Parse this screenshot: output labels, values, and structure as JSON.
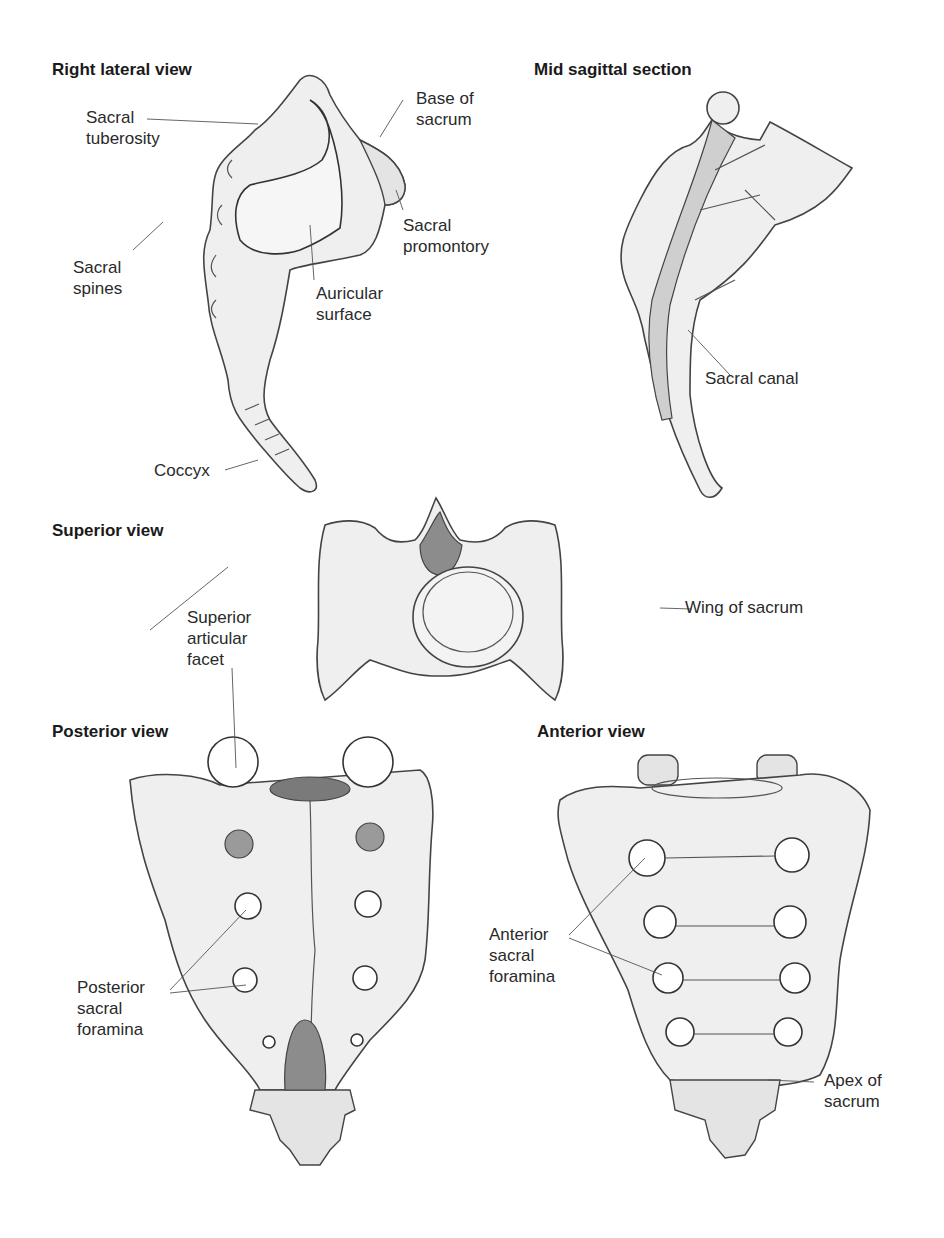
{
  "figure": {
    "background": "#ffffff",
    "panels": [
      {
        "id": "right-lateral",
        "heading": "Right lateral view",
        "labels": [
          "Sacral tuberosity",
          "Base of sacrum",
          "Sacral promontory",
          "Sacral spines",
          "Auricular surface",
          "Coccyx"
        ]
      },
      {
        "id": "mid-sagittal",
        "heading": "Mid sagittal section",
        "labels": [
          "Sacral canal"
        ]
      },
      {
        "id": "superior",
        "heading": "Superior view",
        "labels": [
          "Superior articular facet",
          "Wing of sacrum"
        ]
      },
      {
        "id": "posterior",
        "heading": "Posterior view",
        "labels": [
          "Posterior sacral foramina"
        ]
      },
      {
        "id": "anterior",
        "heading": "Anterior view",
        "labels": [
          "Anterior sacral foramina",
          "Apex of sacrum"
        ]
      }
    ]
  },
  "headings": {
    "right_lateral": "Right lateral view",
    "mid_sagittal": "Mid sagittal section",
    "superior": "Superior view",
    "posterior": "Posterior view",
    "anterior": "Anterior view"
  },
  "labels": {
    "sacral_tuberosity": "Sacral\ntuberosity",
    "base_of_sacrum": "Base of\nsacrum",
    "sacral_promontory": "Sacral\npromontory",
    "sacral_spines": "Sacral\nspines",
    "auricular_surface": "Auricular\nsurface",
    "coccyx": "Coccyx",
    "sacral_canal": "Sacral canal",
    "superior_articular_facet": "Superior\narticular\nfacet",
    "wing_of_sacrum": "Wing of sacrum",
    "posterior_sacral_foramina": "Posterior\nsacral\nforamina",
    "anterior_sacral_foramina": "Anterior\nsacral\nforamina",
    "apex_of_sacrum": "Apex of\nsacrum"
  }
}
